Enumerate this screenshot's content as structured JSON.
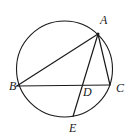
{
  "figure": {
    "kind": "circle-geometry-diagram",
    "background_color": "#ffffff",
    "stroke_color": "#1a1a1a",
    "label_color": "#1a1a1a",
    "circle": {
      "name": "circumscribed-circle",
      "cx": 64.5,
      "cy": 69,
      "r": 48,
      "stroke_width": 1.1
    },
    "points": [
      {
        "id": "A",
        "label": "A",
        "x": 98,
        "y": 34,
        "on_circle": true,
        "label_x": 100,
        "label_y": 14
      },
      {
        "id": "B",
        "label": "B",
        "x": 16.8,
        "y": 86,
        "on_circle": true,
        "label_x": 9,
        "label_y": 80
      },
      {
        "id": "C",
        "label": "C",
        "x": 110,
        "y": 85,
        "on_circle": true,
        "label_x": 116,
        "label_y": 82
      },
      {
        "id": "D",
        "label": "D",
        "x": 76,
        "y": 85.6,
        "on_circle": false,
        "label_x": 83,
        "label_y": 86
      },
      {
        "id": "E",
        "label": "E",
        "x": 73,
        "y": 116.5,
        "on_circle": true,
        "label_x": 69,
        "label_y": 122
      }
    ],
    "segments": [
      {
        "id": "AB",
        "from": "A",
        "to": "B",
        "x1": 98,
        "y1": 34,
        "x2": 16.8,
        "y2": 86
      },
      {
        "id": "AC",
        "from": "A",
        "to": "C",
        "x1": 98,
        "y1": 34,
        "x2": 110,
        "y2": 85
      },
      {
        "id": "AE",
        "from": "A",
        "to": "E",
        "x1": 98,
        "y1": 34,
        "x2": 73,
        "y2": 116.5
      },
      {
        "id": "BC",
        "from": "B",
        "to": "C",
        "x1": 16.8,
        "y1": 86,
        "x2": 110,
        "y2": 85
      }
    ]
  }
}
